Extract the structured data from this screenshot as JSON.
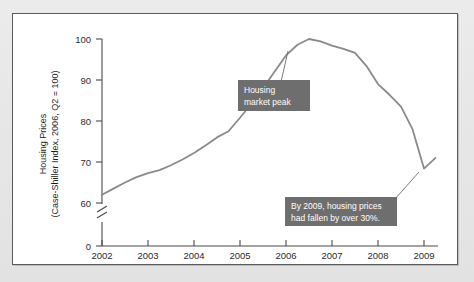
{
  "chart_data": {
    "type": "line",
    "title": "",
    "xlabel": "",
    "ylabel_line1": "Housing Prices",
    "ylabel_line2": "(Case-Shiller Index, 2006, Q2 = 100)",
    "x_tick_labels": [
      "2002",
      "2003",
      "2004",
      "2005",
      "2006",
      "2007",
      "2008",
      "2009"
    ],
    "y_tick_labels": [
      "0",
      "60",
      "70",
      "80",
      "90",
      "100"
    ],
    "y_axis_break": true,
    "y_axis_break_between": [
      0,
      60
    ],
    "ylim": [
      58,
      102
    ],
    "xlim": [
      2002,
      2009.6
    ],
    "grid": false,
    "legend": "none",
    "series": [
      {
        "name": "Case-Shiller Home Price Index",
        "color": "#8a8a8a",
        "x": [
          2002.0,
          2002.25,
          2002.5,
          2002.75,
          2003.0,
          2003.25,
          2003.5,
          2003.75,
          2004.0,
          2004.25,
          2004.5,
          2004.75,
          2005.0,
          2005.25,
          2005.5,
          2005.75,
          2006.0,
          2006.25,
          2006.5,
          2006.75,
          2007.0,
          2007.25,
          2007.5,
          2007.75,
          2008.0,
          2008.25,
          2008.5,
          2008.75,
          2009.0,
          2009.25
        ],
        "y": [
          62.0,
          63.5,
          65.0,
          66.3,
          67.3,
          68.0,
          69.2,
          70.6,
          72.2,
          74.0,
          76.0,
          77.5,
          80.8,
          84.2,
          88.0,
          92.0,
          96.0,
          98.6,
          100.0,
          99.4,
          98.4,
          97.6,
          96.6,
          93.4,
          89.0,
          86.4,
          83.5,
          78.0,
          68.4,
          71.0
        ]
      }
    ],
    "annotations": [
      {
        "id": "housing-market-peak",
        "line1": "Housing",
        "line2": "market peak",
        "box_color": "#6e6e6e",
        "text_color": "#ffffff",
        "points_to_x": 2006.45,
        "points_to_y": 100
      },
      {
        "id": "decline-note",
        "line1": "By 2009, housing prices",
        "line2": "had fallen by over 30%.",
        "box_color": "#6e6e6e",
        "text_color": "#ffffff",
        "points_to_x": 2009.05,
        "points_to_y": 68.4
      }
    ]
  }
}
